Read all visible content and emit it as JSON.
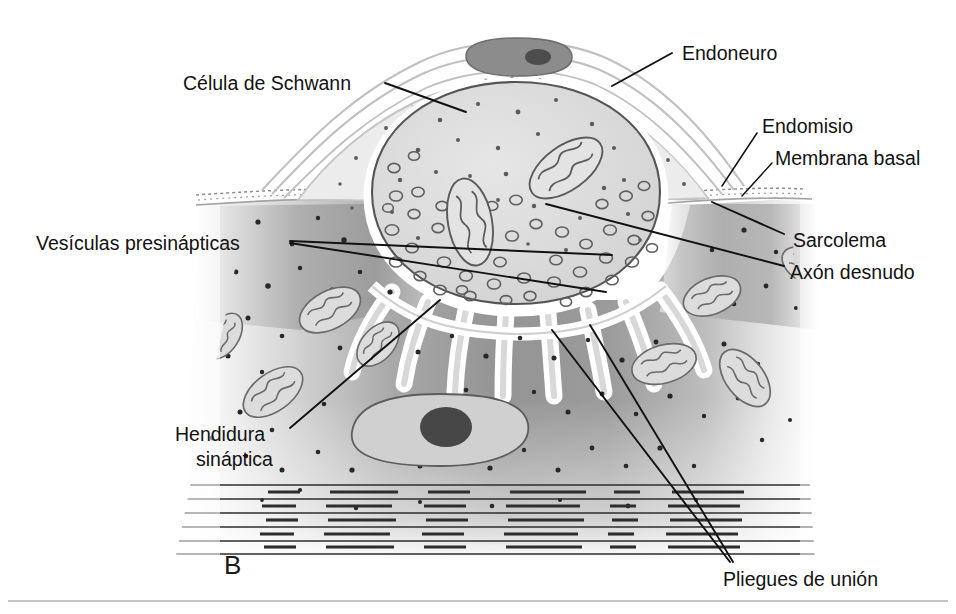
{
  "figure": {
    "panel_letter": "B",
    "language": "es",
    "background_color": "#ffffff",
    "ink_color": "#121212"
  },
  "labels": {
    "celula_de_schwann": "Célula de Schwann",
    "endoneuro": "Endoneuro",
    "endomisio": "Endomisio",
    "membrana_basal": "Membrana basal",
    "sarcolema": "Sarcolema",
    "axon_desnudo": "Axón desnudo",
    "vesiculas_presinapticas": "Vesículas presinápticas",
    "hendidura_linea1": "Hendidura",
    "hendidura_linea2": "sináptica",
    "pliegues_de_union": "Pliegues de unión"
  },
  "palette": {
    "muscle_dark": "#8e8e8e",
    "muscle_mid": "#a6a6a6",
    "muscle_light": "#c9c9c9",
    "axon_fill": "#dcdcdc",
    "schwann_fill": "#e9e9e9",
    "sheath_line": "#b9b9b9",
    "nucleus_fill": "#8c8c8c",
    "nucleolus_fill": "#4a4a4a",
    "fold_light": "#ffffff",
    "stipple": "#2b2b2b",
    "rule_line": "#b0b0b0"
  },
  "structures": [
    {
      "name": "axon-terminal",
      "description": "nerve terminal packed with synaptic vesicles and mitochondria"
    },
    {
      "name": "schwann-cell",
      "description": "glial cell capping the terminal, contains nucleus"
    },
    {
      "name": "schwann-nucleus",
      "description": "dark elongated nucleus with nucleolus"
    },
    {
      "name": "endoneurium-sheets",
      "description": "thin concentric connective sheets over the terminal"
    },
    {
      "name": "basal-lamina",
      "description": "stippled band between nerve and muscle"
    },
    {
      "name": "junctional-folds",
      "description": "invaginations of the sarcolemma under the terminal"
    },
    {
      "name": "muscle-fiber",
      "description": "sarcoplasm with mitochondria, stipple and myofibril striations"
    },
    {
      "name": "muscle-nucleus",
      "description": "pale oval nucleus with dark nucleolus inside muscle fiber"
    },
    {
      "name": "myofibril-striations",
      "description": "horizontal banded lines at the base of the muscle fiber"
    }
  ]
}
